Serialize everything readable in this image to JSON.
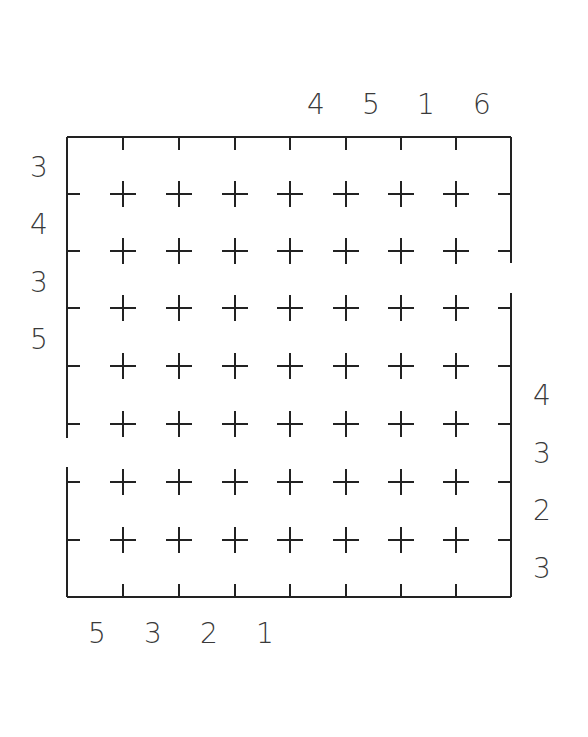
{
  "puzzle": {
    "grid": {
      "rows": 8,
      "cols": 8
    },
    "frame": {
      "left": 67,
      "top": 137,
      "right": 511,
      "bottom": 597,
      "stroke": "#222222"
    },
    "col_x": [
      123,
      179,
      235,
      290,
      346,
      401,
      456
    ],
    "row_y": [
      194,
      251,
      308,
      366,
      424,
      482,
      540
    ],
    "left_wall_gap": [
      438,
      467
    ],
    "right_wall_gap": [
      263,
      293
    ],
    "clues": {
      "top": [
        {
          "value": "4",
          "x": 316,
          "y": 105
        },
        {
          "value": "5",
          "x": 371,
          "y": 105
        },
        {
          "value": "1",
          "x": 426,
          "y": 105
        },
        {
          "value": "6",
          "x": 482,
          "y": 105
        }
      ],
      "left": [
        {
          "value": "3",
          "x": 39,
          "y": 168
        },
        {
          "value": "4",
          "x": 39,
          "y": 225
        },
        {
          "value": "3",
          "x": 39,
          "y": 283
        },
        {
          "value": "5",
          "x": 39,
          "y": 340
        }
      ],
      "right": [
        {
          "value": "4",
          "x": 542,
          "y": 396
        },
        {
          "value": "3",
          "x": 542,
          "y": 454
        },
        {
          "value": "2",
          "x": 542,
          "y": 511
        },
        {
          "value": "3",
          "x": 542,
          "y": 569
        }
      ],
      "bottom": [
        {
          "value": "5",
          "x": 97,
          "y": 634
        },
        {
          "value": "3",
          "x": 153,
          "y": 634
        },
        {
          "value": "2",
          "x": 209,
          "y": 634
        },
        {
          "value": "1",
          "x": 265,
          "y": 634
        }
      ]
    }
  }
}
